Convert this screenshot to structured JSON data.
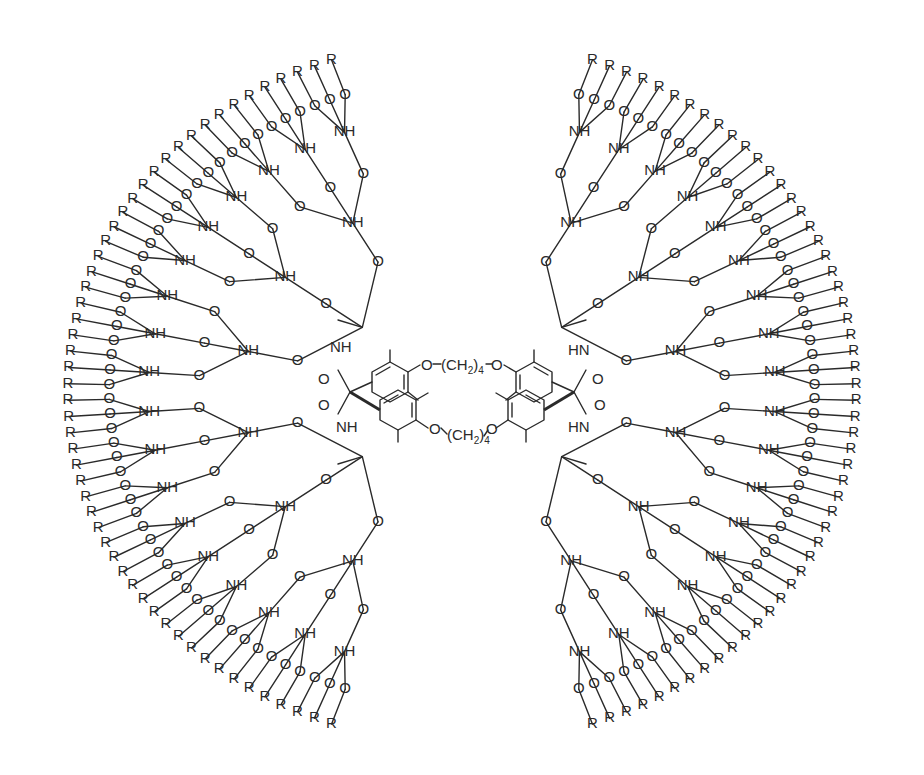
{
  "figure": {
    "type": "chemical-structure",
    "title": ""
  },
  "core": {
    "linker_top": "O-(CH2)4-O",
    "linker_bottom": "O-(CH2)4-O",
    "linker_text": "(CH",
    "linker_sub2": "2",
    "linker_close": ")",
    "linker_sub4": "4",
    "oxygen": "O",
    "aryl_rings": 4,
    "methyl_substituents_per_ring": 2
  },
  "labels": {
    "amide_nh": "NH",
    "amide_hn": "HN",
    "amide_h": "H",
    "carbonyl_o": "O",
    "ether_o": "O",
    "terminal_group": "R"
  },
  "dendron": {
    "quadrants": [
      "upper-left",
      "upper-right",
      "lower-left",
      "lower-right"
    ],
    "branching_per_node": 3,
    "generations": 3,
    "terminal_groups_per_quadrant": 27,
    "terminal_groups_total": 108
  },
  "colors": {
    "ink": "#2a2a2a",
    "background": "#ffffff"
  }
}
